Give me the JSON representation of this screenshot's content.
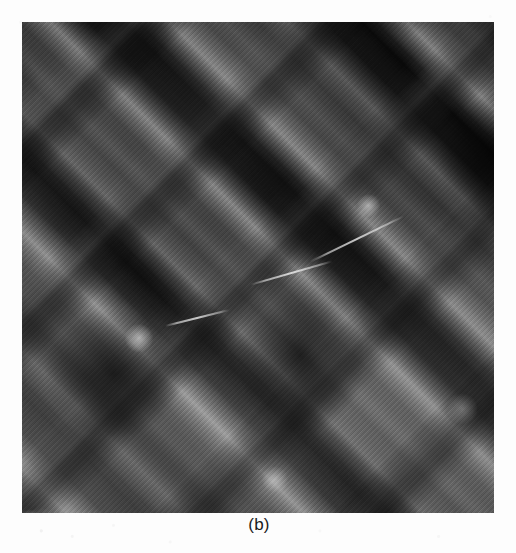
{
  "figure": {
    "caption": "(b)",
    "panel_label": "(b)",
    "alt_description": "Grayscale micrograph panel with two crossing families of diagonal bright bands",
    "colors": {
      "page_background": "#fdfdfd",
      "panel_background": "#0a0a0a",
      "band_highlight": "#ffffff",
      "caption_text": "#1a1a1a"
    },
    "panel_geometry": {
      "left": "22px",
      "top": "22px",
      "width": "472px",
      "height": "491px"
    },
    "hairlines": [
      {
        "left": "48%",
        "top": "51%",
        "width": "18%",
        "rotate": "-16deg"
      },
      {
        "left": "60%",
        "top": "44%",
        "width": "22%",
        "rotate": "-26deg"
      },
      {
        "left": "30%",
        "top": "60%",
        "width": "14%",
        "rotate": "-14deg"
      }
    ]
  },
  "chart_data": {
    "type": "heatmap",
    "title": "(b)",
    "xlabel": "",
    "ylabel": "",
    "grid": false,
    "legend": "none",
    "colormap": "grayscale",
    "value_range": [
      0,
      255
    ],
    "band_families": [
      {
        "name": "family-A",
        "orientation_deg": -45,
        "period_px": 84,
        "peak_intensity": 210,
        "note": "dominant, broader lobed bands"
      },
      {
        "name": "family-B",
        "orientation_deg": 45,
        "period_px": 128,
        "peak_intensity": 170,
        "note": "thinner, sparser crossing bands"
      }
    ],
    "hotspots": [
      {
        "x_pct": 23.0,
        "y_pct": 79.5,
        "intensity": 250
      },
      {
        "x_pct": 36.0,
        "y_pct": 58.0,
        "intensity": 215
      },
      {
        "x_pct": 63.0,
        "y_pct": 43.0,
        "intensity": 205
      },
      {
        "x_pct": 87.0,
        "y_pct": 22.5,
        "intensity": 190
      },
      {
        "x_pct": 89.0,
        "y_pct": 84.0,
        "intensity": 185
      },
      {
        "x_pct": 10.0,
        "y_pct": 74.0,
        "intensity": 175
      }
    ],
    "background_level": 18
  }
}
